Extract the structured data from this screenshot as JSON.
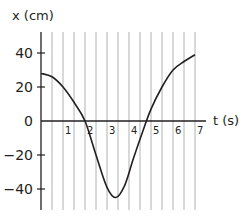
{
  "chart_data": {
    "type": "line",
    "title": "",
    "xlabel": "t (s)",
    "ylabel": "x (cm)",
    "xlim": [
      0,
      7
    ],
    "ylim": [
      -50,
      50
    ],
    "x_ticks": [
      1,
      2,
      3,
      4,
      5,
      6,
      7
    ],
    "x_tick_labels": [
      "1",
      "2",
      "3",
      "4",
      "5",
      "6",
      "7"
    ],
    "y_ticks": [
      40,
      20,
      0,
      -20,
      -40
    ],
    "y_tick_labels": [
      "40",
      "20",
      "0",
      "−20",
      "−40"
    ],
    "grid": {
      "vertical": true,
      "horizontal": false,
      "spacing_s": 0.5
    },
    "legend": null,
    "series": [
      {
        "name": "x(t)",
        "x": [
          0,
          0.5,
          1,
          1.5,
          2,
          2.5,
          3,
          3.4,
          3.8,
          4.2,
          4.6,
          5,
          5.5,
          6,
          6.5,
          7
        ],
        "values": [
          28,
          26,
          20,
          11,
          0,
          -20,
          -39,
          -45,
          -38,
          -22,
          -7,
          7,
          20,
          30,
          35,
          39
        ]
      }
    ],
    "annotations": []
  },
  "labels": {
    "y_axis": "x (cm)",
    "x_axis": "t (s)",
    "y_ticks": [
      "40",
      "20",
      "0",
      "−20",
      "−40"
    ],
    "x_ticks": [
      "1",
      "2",
      "3",
      "4",
      "5",
      "6",
      "7"
    ]
  },
  "colors": {
    "axis": "#231f20",
    "grid": "#a7a9ac",
    "curve": "#231f20",
    "text": "#231f20"
  }
}
